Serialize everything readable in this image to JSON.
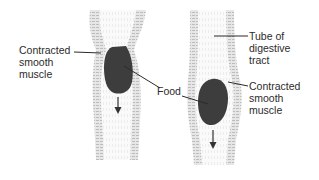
{
  "diagram": {
    "type": "peristalsis-illustration",
    "panels": [
      {
        "id": "left",
        "description": "Contracted muscle above food bolus, food moving down"
      },
      {
        "id": "right",
        "description": "Food bolus moved further down the tube, contraction follows"
      }
    ]
  },
  "labels": {
    "left_contracted": "Contracted\nsmooth\nmuscle",
    "food": "Food",
    "tube": "Tube of\ndigestive\ntract",
    "right_contracted": "Contracted\nsmooth\nmuscle"
  },
  "colors": {
    "food": "#3d3d3d",
    "wall": "#cfcfcf",
    "wall_stripe": "#b8b8b8",
    "leader": "#2b2b2b",
    "text": "#2b2b2b"
  },
  "icons": {
    "left_arrow": "down-arrow",
    "right_arrow": "down-arrow"
  }
}
